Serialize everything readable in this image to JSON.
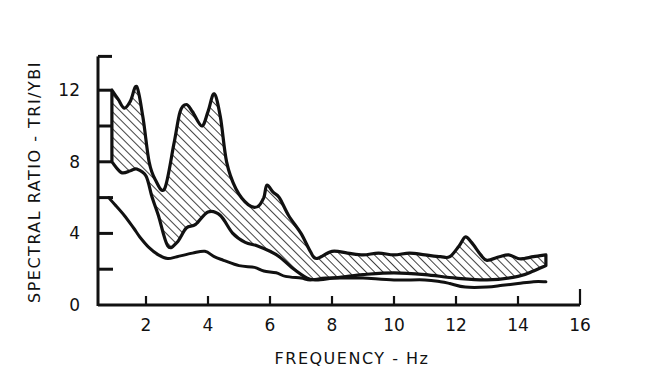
{
  "chart_data": {
    "type": "area",
    "title": "",
    "xlabel": "FREQUENCY - Hz",
    "ylabel": "SPECTRAL RATIO - TRI/YBI",
    "xlim": [
      0,
      16
    ],
    "ylim": [
      0,
      14
    ],
    "x_ticks": [
      2,
      4,
      6,
      8,
      10,
      12,
      14,
      16
    ],
    "x_tick_labels": [
      "2",
      "4",
      "6",
      "8",
      "10",
      "12",
      "14",
      "16"
    ],
    "y_ticks": [
      0,
      2,
      4,
      6,
      8,
      10,
      12,
      14
    ],
    "y_tick_labels": [
      "0",
      "4",
      "8",
      "12"
    ],
    "y_labeled_ticks": [
      0,
      4,
      8,
      12
    ],
    "grid": false,
    "legend": null,
    "series": [
      {
        "name": "Hatched band - upper bound",
        "style": "band-upper",
        "x": [
          0.9,
          1.1,
          1.3,
          1.5,
          1.7,
          1.9,
          2.1,
          2.3,
          2.6,
          2.9,
          3.1,
          3.3,
          3.5,
          3.8,
          4.0,
          4.2,
          4.4,
          4.6,
          4.9,
          5.3,
          5.6,
          5.8,
          5.9,
          6.1,
          6.3,
          6.6,
          7.0,
          7.3,
          7.5,
          8.0,
          8.5,
          9.0,
          9.5,
          10.0,
          10.5,
          11.0,
          11.5,
          11.8,
          12.1,
          12.3,
          12.5,
          12.8,
          13.0,
          13.4,
          13.7,
          14.0,
          14.2,
          14.5,
          14.9
        ],
        "values": [
          12.0,
          11.5,
          11.0,
          11.4,
          12.2,
          10.5,
          8.0,
          7.0,
          6.5,
          9.0,
          10.8,
          11.2,
          10.8,
          10.0,
          10.8,
          11.8,
          10.5,
          8.0,
          6.5,
          5.6,
          5.5,
          6.0,
          6.7,
          6.3,
          6.0,
          5.0,
          4.0,
          3.0,
          2.6,
          3.0,
          2.9,
          2.8,
          2.9,
          2.8,
          2.9,
          2.8,
          2.7,
          2.7,
          3.3,
          3.8,
          3.5,
          2.8,
          2.5,
          2.7,
          2.8,
          2.6,
          2.6,
          2.7,
          2.8
        ]
      },
      {
        "name": "Hatched band - lower bound",
        "style": "band-lower",
        "x": [
          0.9,
          1.2,
          1.5,
          1.7,
          2.0,
          2.2,
          2.4,
          2.7,
          3.0,
          3.3,
          3.6,
          4.0,
          4.4,
          4.8,
          5.2,
          5.6,
          6.0,
          6.3,
          6.7,
          7.2,
          7.5,
          8.0,
          8.5,
          9.0,
          10.0,
          11.0,
          12.0,
          13.0,
          14.0,
          14.5,
          14.9
        ],
        "values": [
          8.0,
          7.4,
          7.5,
          7.6,
          7.2,
          6.0,
          5.0,
          3.3,
          3.5,
          4.3,
          4.5,
          5.2,
          5.0,
          4.0,
          3.5,
          3.3,
          3.0,
          2.7,
          2.1,
          1.5,
          1.4,
          1.5,
          1.6,
          1.7,
          1.8,
          1.7,
          1.5,
          1.4,
          1.6,
          1.9,
          2.2
        ]
      },
      {
        "name": "Lower curve",
        "style": "line",
        "x": [
          0.8,
          1.0,
          1.3,
          1.6,
          1.8,
          2.1,
          2.4,
          2.7,
          3.0,
          3.5,
          3.9,
          4.2,
          4.5,
          5.0,
          5.5,
          5.8,
          6.2,
          6.5,
          7.0,
          7.3,
          7.8,
          8.5,
          9.0,
          10.0,
          11.0,
          11.5,
          11.8,
          12.3,
          13.0,
          13.5,
          14.0,
          14.5,
          14.9
        ],
        "values": [
          6.0,
          5.6,
          5.0,
          4.3,
          3.8,
          3.2,
          2.8,
          2.6,
          2.7,
          2.9,
          3.0,
          2.7,
          2.5,
          2.2,
          2.1,
          1.9,
          1.8,
          1.6,
          1.5,
          1.4,
          1.5,
          1.5,
          1.5,
          1.4,
          1.4,
          1.3,
          1.2,
          1.0,
          1.0,
          1.1,
          1.2,
          1.3,
          1.3
        ]
      }
    ]
  },
  "colors": {
    "ink": "#111111",
    "background": "#ffffff"
  }
}
